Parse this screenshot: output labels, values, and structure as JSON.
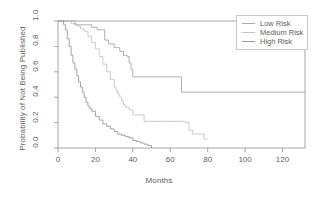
{
  "figure": {
    "background_color": "#ffffff",
    "axis_color": "#8f8f8f",
    "text_color": "#5e5e5e"
  },
  "legend": {
    "position": "top-right",
    "border_color": "#c9c9c9",
    "entries": [
      {
        "label": "Low Risk",
        "color": "#a8a8a8"
      },
      {
        "label": "Medium Risk",
        "color": "#c4c4c4"
      },
      {
        "label": "High Risk",
        "color": "#9a9a9a"
      }
    ]
  },
  "chart_data": {
    "type": "line",
    "title": "",
    "subtitle": "",
    "xlabel": "Months",
    "ylabel": "Probability of Not Being Published",
    "xlim": [
      0,
      132
    ],
    "ylim": [
      0,
      1.0
    ],
    "xticks": [
      0,
      20,
      40,
      60,
      80,
      100,
      120
    ],
    "yticks": [
      0.0,
      0.2,
      0.4,
      0.6,
      0.8,
      1.0
    ],
    "xtick_labels": [
      "0",
      "20",
      "40",
      "60",
      "80",
      "100",
      "120"
    ],
    "ytick_labels": [
      "0.0",
      "0.2",
      "0.4",
      "0.6",
      "0.8",
      "1.0"
    ],
    "grid": false,
    "legend_position": "top-right",
    "annotations": [],
    "step_type": "post",
    "series": [
      {
        "name": "Low Risk",
        "color": "#a8a8a8",
        "x": [
          0,
          6,
          9,
          14,
          18,
          21,
          24,
          25,
          27,
          30,
          33,
          35,
          37,
          38,
          39,
          40,
          64,
          66,
          132
        ],
        "y": [
          1.0,
          1.0,
          0.97,
          0.97,
          0.95,
          0.93,
          0.93,
          0.85,
          0.82,
          0.79,
          0.76,
          0.73,
          0.72,
          0.67,
          0.62,
          0.56,
          0.56,
          0.44,
          0.44
        ]
      },
      {
        "name": "Medium Risk",
        "color": "#c4c4c4",
        "x": [
          0,
          4,
          7,
          10,
          12,
          14,
          16,
          18,
          20,
          22,
          24,
          26,
          28,
          30,
          31,
          32,
          33,
          34,
          35,
          36,
          38,
          40,
          46,
          56,
          64,
          68,
          70,
          72,
          78,
          80
        ],
        "y": [
          1.0,
          1.0,
          0.98,
          0.96,
          0.94,
          0.92,
          0.88,
          0.83,
          0.78,
          0.72,
          0.66,
          0.6,
          0.54,
          0.48,
          0.45,
          0.42,
          0.4,
          0.37,
          0.34,
          0.32,
          0.3,
          0.26,
          0.21,
          0.21,
          0.21,
          0.2,
          0.14,
          0.11,
          0.07,
          0.07
        ]
      },
      {
        "name": "High Risk",
        "color": "#9a9a9a",
        "x": [
          0,
          2,
          3,
          4,
          5,
          6,
          7,
          8,
          9,
          10,
          11,
          12,
          13,
          14,
          15,
          16,
          17,
          18,
          20,
          22,
          24,
          26,
          28,
          30,
          32,
          34,
          36,
          38,
          40,
          42,
          44,
          46,
          48,
          50
        ],
        "y": [
          1.0,
          1.0,
          0.97,
          0.93,
          0.86,
          0.8,
          0.73,
          0.67,
          0.62,
          0.57,
          0.52,
          0.48,
          0.44,
          0.4,
          0.36,
          0.33,
          0.31,
          0.29,
          0.25,
          0.22,
          0.19,
          0.17,
          0.15,
          0.13,
          0.11,
          0.1,
          0.09,
          0.08,
          0.06,
          0.05,
          0.04,
          0.03,
          0.02,
          0.0
        ]
      }
    ]
  }
}
